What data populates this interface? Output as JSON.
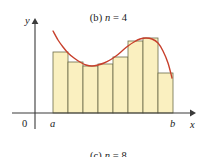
{
  "captions": {
    "top_prefix": "(b) ",
    "top_var": "n",
    "top_eq": " = 4",
    "top_full": "(b) n = 4",
    "bottom_prefix": "(c) ",
    "bottom_var": "n",
    "bottom_eq": " = 8",
    "bottom_full": "(c) n = 8"
  },
  "axes": {
    "y_label": "y",
    "x_label": "x",
    "origin_label": "0",
    "left_bound_label": "a",
    "right_bound_label": "b"
  },
  "colors": {
    "rect_fill": "#faf0c0",
    "rect_stroke": "#6b6b4a",
    "curve": "#c8402c",
    "axis": "#3a3a3a",
    "text": "#1a1a1a",
    "background": "#ffffff"
  },
  "chart_data": {
    "type": "bar",
    "title": "(c) n = 8",
    "xlabel": "x",
    "ylabel": "y",
    "grid": false,
    "legend": null,
    "n": 8,
    "interval": [
      "a",
      "b"
    ],
    "x_axis_px": {
      "a": 53,
      "b": 173,
      "baseline_y": 113
    },
    "categories": [
      "1",
      "2",
      "3",
      "4",
      "5",
      "6",
      "7",
      "8"
    ],
    "rect_edges_px": [
      53,
      68,
      83,
      98,
      113,
      128,
      143,
      158,
      173
    ],
    "rect_top_px": [
      52,
      62,
      66,
      64,
      57,
      41,
      38,
      73
    ],
    "values": [
      61,
      51,
      47,
      49,
      56,
      72,
      75,
      40
    ],
    "ylim": [
      0,
      90
    ],
    "curve": {
      "name": "f(x)",
      "points_px": [
        [
          53,
          31
        ],
        [
          58,
          40
        ],
        [
          63,
          47
        ],
        [
          68,
          53
        ],
        [
          74,
          58
        ],
        [
          80,
          62
        ],
        [
          86,
          65
        ],
        [
          92,
          66
        ],
        [
          98,
          65
        ],
        [
          104,
          63
        ],
        [
          110,
          60
        ],
        [
          116,
          56
        ],
        [
          122,
          51
        ],
        [
          128,
          46
        ],
        [
          134,
          42
        ],
        [
          140,
          39
        ],
        [
          146,
          38
        ],
        [
          152,
          39
        ],
        [
          158,
          43
        ],
        [
          163,
          51
        ],
        [
          168,
          63
        ],
        [
          172,
          78
        ]
      ]
    }
  }
}
